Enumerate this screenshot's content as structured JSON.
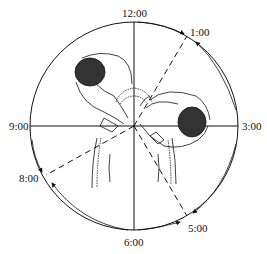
{
  "diagram": {
    "type": "clock-position-diagram",
    "clock_labels": {
      "twelve": "12:00",
      "one": "1:00",
      "three": "3:00",
      "five": "5:00",
      "six": "6:00",
      "eight": "8:00",
      "nine": "9:00"
    },
    "figures": [
      "surgeon-left-upper",
      "surgeon-right-lower",
      "patient-torso"
    ],
    "arrows": [
      {
        "from": "12:00",
        "to": "1:00"
      },
      {
        "from": "3:00",
        "to": "1:00"
      },
      {
        "from": "3:00",
        "to": "5:00"
      },
      {
        "from": "6:00",
        "to": "5:00"
      },
      {
        "from": "9:00",
        "to": "8:00"
      },
      {
        "from": "6:00",
        "to": "8:00"
      }
    ],
    "colors": {
      "line": "#111111",
      "background": "#ffffff"
    }
  }
}
